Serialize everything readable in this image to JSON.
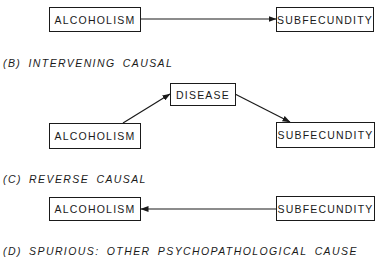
{
  "colors": {
    "ink": "#1a1a1a",
    "background": "#ffffff"
  },
  "panels": {
    "a": {
      "label": "",
      "nodes": {
        "left": "ALCOHOLISM",
        "right": "SUBFECUNDITY"
      },
      "edges": [
        {
          "from": "ALCOHOLISM",
          "to": "SUBFECUNDITY"
        }
      ]
    },
    "b": {
      "label": "(B) INTERVENING CAUSAL",
      "nodes": {
        "left": "ALCOHOLISM",
        "middle": "DISEASE",
        "right": "SUBFECUNDITY"
      },
      "edges": [
        {
          "from": "ALCOHOLISM",
          "to": "DISEASE"
        },
        {
          "from": "DISEASE",
          "to": "SUBFECUNDITY"
        }
      ]
    },
    "c": {
      "label": "(C) REVERSE CAUSAL",
      "nodes": {
        "left": "ALCOHOLISM",
        "right": "SUBFECUNDITY"
      },
      "edges": [
        {
          "from": "SUBFECUNDITY",
          "to": "ALCOHOLISM"
        }
      ]
    },
    "d": {
      "label": "(D) SPURIOUS: OTHER PSYCHOPATHOLOGICAL CAUSE"
    }
  }
}
